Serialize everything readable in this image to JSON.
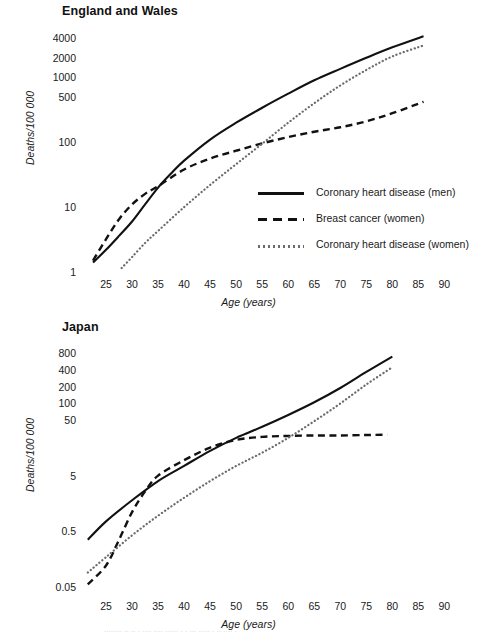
{
  "figure": {
    "background": "#ffffff",
    "ink": "#111111",
    "dotted_color": "#6b6b6b"
  },
  "panels": [
    {
      "key": "england",
      "title": "England and Wales",
      "ylabel": "Deaths/100 000",
      "xlabel": "Age (years)"
    },
    {
      "key": "japan",
      "title": "Japan",
      "ylabel": "Deaths/100 000",
      "xlabel": "Age (years)"
    }
  ],
  "legend": {
    "items": [
      {
        "label": "Coronary heart disease (men)",
        "style": "solid"
      },
      {
        "label": "Breast cancer (women)",
        "style": "dashed"
      },
      {
        "label": "Coronary heart disease (women)",
        "style": "dotted"
      }
    ]
  },
  "bleed": {
    "text": "........ ..  .. . .... ....  ...... . . ...  ..... . ..   ....  ."
  },
  "chart_data": [
    {
      "type": "line",
      "title": "England and Wales",
      "xlabel": "Age (years)",
      "ylabel": "Deaths/100 000",
      "xlim": [
        20,
        93
      ],
      "ylim": [
        1,
        5000
      ],
      "yscale": "log",
      "grid": false,
      "legend_position": "inside-lower-right",
      "xticks": [
        25,
        30,
        35,
        40,
        45,
        50,
        55,
        60,
        65,
        70,
        75,
        80,
        85,
        90
      ],
      "yticks": [
        1,
        10,
        100,
        500,
        1000,
        2000,
        4000
      ],
      "ytick_labels": [
        "1",
        "10",
        "100",
        "500",
        "1000",
        "2000",
        "4000"
      ],
      "series": [
        {
          "name": "Coronary heart disease (men)",
          "style": "solid",
          "x": [
            22.5,
            25,
            27.5,
            30,
            32.5,
            35,
            37.5,
            40,
            45,
            50,
            55,
            60,
            65,
            70,
            75,
            80,
            86
          ],
          "y": [
            1.4,
            2.2,
            3.6,
            6.0,
            11.0,
            20.0,
            33.0,
            52.0,
            110.0,
            200.0,
            340.0,
            560.0,
            900.0,
            1350.0,
            2000.0,
            2900.0,
            4300.0
          ]
        },
        {
          "name": "Breast cancer (women)",
          "style": "dashed",
          "x": [
            22.5,
            25,
            27.5,
            30,
            32.5,
            35,
            40,
            45,
            50,
            55,
            60,
            65,
            70,
            75,
            80,
            86
          ],
          "y": [
            1.5,
            3.2,
            6.5,
            11.0,
            16.0,
            21.0,
            38.0,
            56.0,
            74.0,
            96.0,
            120.0,
            145.0,
            170.0,
            210.0,
            280.0,
            420.0
          ]
        },
        {
          "name": "Coronary heart disease (women)",
          "style": "dotted",
          "x": [
            28,
            30,
            32.5,
            35,
            40,
            45,
            50,
            55,
            60,
            65,
            70,
            75,
            80,
            86
          ],
          "y": [
            1.15,
            1.7,
            2.8,
            4.3,
            10.0,
            22.0,
            46.0,
            95.0,
            200.0,
            400.0,
            750.0,
            1300.0,
            2100.0,
            3100.0
          ]
        }
      ]
    },
    {
      "type": "line",
      "title": "Japan",
      "xlabel": "Age (years)",
      "ylabel": "Deaths/100 000",
      "xlim": [
        20,
        93
      ],
      "ylim": [
        0.04,
        1000
      ],
      "yscale": "log",
      "grid": false,
      "legend_position": "none",
      "xticks": [
        25,
        30,
        35,
        40,
        45,
        50,
        55,
        60,
        65,
        70,
        75,
        80,
        85,
        90
      ],
      "yticks": [
        0.05,
        0.5,
        5,
        50,
        100,
        200,
        400,
        800
      ],
      "ytick_labels": [
        "0.05",
        "0.5",
        "5",
        "50",
        "100",
        "200",
        "400",
        "800"
      ],
      "series": [
        {
          "name": "Coronary heart disease (men)",
          "style": "solid",
          "x": [
            21.5,
            25,
            30,
            35,
            40,
            45,
            50,
            55,
            60,
            65,
            70,
            75,
            80
          ],
          "y": [
            0.35,
            0.75,
            1.8,
            4.0,
            7.5,
            14.0,
            24.0,
            38.0,
            62.0,
            105.0,
            190.0,
            370.0,
            700.0
          ]
        },
        {
          "name": "Breast cancer (women)",
          "style": "dashed",
          "x": [
            21.5,
            25,
            27.5,
            30,
            32.5,
            35,
            40,
            45,
            50,
            55,
            60,
            65,
            70,
            75,
            79
          ],
          "y": [
            0.055,
            0.12,
            0.35,
            1.1,
            2.6,
            5.0,
            9.5,
            16.0,
            22.0,
            25.0,
            26.0,
            26.5,
            26.5,
            27.0,
            27.5
          ]
        },
        {
          "name": "Coronary heart disease (women)",
          "style": "dotted",
          "x": [
            21.5,
            25,
            30,
            35,
            40,
            45,
            50,
            55,
            60,
            65,
            70,
            75,
            80
          ],
          "y": [
            0.09,
            0.17,
            0.42,
            0.95,
            2.0,
            4.0,
            7.5,
            13.0,
            24.0,
            48.0,
            100.0,
            220.0,
            450.0
          ]
        }
      ]
    }
  ]
}
